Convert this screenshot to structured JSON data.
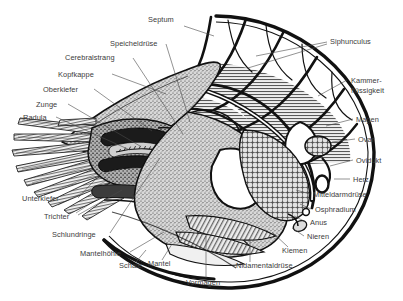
{
  "figure": {
    "style": "black-and-white scientific line engraving with stipple and hatch shading",
    "background_color": "#ffffff",
    "label_color": "#3b3b3b",
    "leader_color": "#4a4a4a",
    "ink_color": "#111111",
    "shell_fill": "#ffffff",
    "chamber_fluid_fill": "#c9c9c9",
    "hood_fill": "#b6b6b6",
    "tissue_fill": "#9a9a9a",
    "organ_fill": "#7d7d7d"
  },
  "labels": [
    {
      "id": "septum",
      "text": "Septum",
      "x": 148,
      "y": 22,
      "anchor": "start"
    },
    {
      "id": "speicheldruese",
      "text": "Speicheldrüse",
      "x": 110,
      "y": 46,
      "anchor": "start"
    },
    {
      "id": "cerebralstrang",
      "text": "Cerebralstrang",
      "x": 65,
      "y": 60,
      "anchor": "start"
    },
    {
      "id": "kopfkappe",
      "text": "Kopfkappe",
      "x": 58,
      "y": 77,
      "anchor": "start"
    },
    {
      "id": "oberkiefer",
      "text": "Oberkiefer",
      "x": 43,
      "y": 92,
      "anchor": "start"
    },
    {
      "id": "zunge",
      "text": "Zunge",
      "x": 36,
      "y": 107,
      "anchor": "start"
    },
    {
      "id": "radula",
      "text": "Radula",
      "x": 23,
      "y": 120,
      "anchor": "start"
    },
    {
      "id": "unterkiefer",
      "text": "Unterkiefer",
      "x": 22,
      "y": 201,
      "anchor": "start"
    },
    {
      "id": "trichter",
      "text": "Trichter",
      "x": 44,
      "y": 219,
      "anchor": "start"
    },
    {
      "id": "schlundringe",
      "text": "Schlundringe",
      "x": 52,
      "y": 237,
      "anchor": "start"
    },
    {
      "id": "mantelhoehle",
      "text": "Mantelhöhle",
      "x": 80,
      "y": 256,
      "anchor": "start"
    },
    {
      "id": "schale",
      "text": "Schale",
      "x": 119,
      "y": 268,
      "anchor": "start"
    },
    {
      "id": "mantel",
      "text": "Mantel",
      "x": 148,
      "y": 266,
      "anchor": "start"
    },
    {
      "id": "vormagen",
      "text": "Vormagen",
      "x": 186,
      "y": 285,
      "anchor": "start"
    },
    {
      "id": "nidamentaldruese",
      "text": "Nidamentaldrüse",
      "x": 236,
      "y": 268,
      "anchor": "start"
    },
    {
      "id": "kiemen",
      "text": "Kiemen",
      "x": 282,
      "y": 253,
      "anchor": "start"
    },
    {
      "id": "nieren",
      "text": "Nieren",
      "x": 307,
      "y": 239,
      "anchor": "start"
    },
    {
      "id": "anus",
      "text": "Anus",
      "x": 310,
      "y": 225,
      "anchor": "start"
    },
    {
      "id": "osphradium",
      "text": "Osphradium",
      "x": 315,
      "y": 212,
      "anchor": "start"
    },
    {
      "id": "mitteldarmdruese",
      "text": "Mitteldarmdrüse",
      "x": 313,
      "y": 197,
      "anchor": "start"
    },
    {
      "id": "herz",
      "text": "Herz",
      "x": 353,
      "y": 182,
      "anchor": "start"
    },
    {
      "id": "ovidukt",
      "text": "Ovidukt",
      "x": 356,
      "y": 163,
      "anchor": "start"
    },
    {
      "id": "ovar",
      "text": "Ovar",
      "x": 358,
      "y": 142,
      "anchor": "start"
    },
    {
      "id": "magen",
      "text": "Magen",
      "x": 356,
      "y": 122,
      "anchor": "start"
    },
    {
      "id": "siphunculus",
      "text": "Siphunculus",
      "x": 330,
      "y": 44,
      "anchor": "start"
    }
  ],
  "labels_multiline": [
    {
      "id": "kammerfluessigkeit",
      "line1": "Kammer-",
      "line2": "flüssigkeit",
      "x": 351,
      "y": 83,
      "anchor": "start"
    }
  ]
}
